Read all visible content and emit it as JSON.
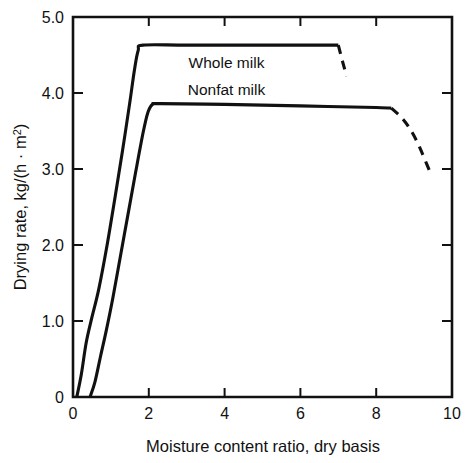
{
  "chart_data": {
    "type": "line",
    "title": "",
    "xlabel": "Moisture content ratio, dry basis",
    "ylabel": "Drying rate, kg/(h · m²)",
    "ylabel_parts": {
      "main": "Drying rate, kg/(h · m",
      "superscript": "2",
      "tail": ")"
    },
    "xlim": [
      0,
      10
    ],
    "ylim": [
      0,
      5.0
    ],
    "xticks": [
      0,
      2,
      4,
      6,
      8,
      10
    ],
    "xticklabels": [
      "0",
      "2",
      "4",
      "6",
      "8",
      "10"
    ],
    "yticks": [
      0,
      1.0,
      2.0,
      3.0,
      4.0,
      5.0
    ],
    "yticklabels": [
      "0",
      "1.0",
      "2.0",
      "3.0",
      "4.0",
      "5.0"
    ],
    "grid": false,
    "legend": "inline-labels",
    "frame": "box",
    "tick_direction": "mixed",
    "series": [
      {
        "name": "Whole milk",
        "label_x": 4.05,
        "label_y": 4.33,
        "solid_points": [
          [
            0.1,
            0.0
          ],
          [
            0.22,
            0.3
          ],
          [
            0.35,
            0.72
          ],
          [
            0.5,
            1.05
          ],
          [
            0.68,
            1.42
          ],
          [
            0.9,
            2.0
          ],
          [
            1.1,
            2.6
          ],
          [
            1.3,
            3.22
          ],
          [
            1.5,
            3.88
          ],
          [
            1.62,
            4.3
          ],
          [
            1.72,
            4.56
          ],
          [
            1.85,
            4.63
          ],
          [
            3.0,
            4.63
          ],
          [
            5.0,
            4.63
          ],
          [
            7.0,
            4.63
          ]
        ],
        "dashed_points": [
          [
            7.0,
            4.63
          ],
          [
            7.12,
            4.4
          ],
          [
            7.22,
            4.22
          ]
        ]
      },
      {
        "name": "Nonfat milk",
        "label_x": 4.05,
        "label_y": 3.97,
        "solid_points": [
          [
            0.45,
            0.0
          ],
          [
            0.58,
            0.2
          ],
          [
            0.72,
            0.52
          ],
          [
            0.88,
            0.88
          ],
          [
            1.05,
            1.3
          ],
          [
            1.25,
            1.85
          ],
          [
            1.45,
            2.4
          ],
          [
            1.65,
            2.95
          ],
          [
            1.85,
            3.48
          ],
          [
            1.98,
            3.75
          ],
          [
            2.1,
            3.85
          ],
          [
            2.3,
            3.86
          ],
          [
            4.0,
            3.85
          ],
          [
            6.0,
            3.83
          ],
          [
            8.0,
            3.81
          ],
          [
            8.4,
            3.8
          ]
        ],
        "dashed_points": [
          [
            8.4,
            3.8
          ],
          [
            8.7,
            3.66
          ],
          [
            8.95,
            3.48
          ],
          [
            9.15,
            3.28
          ],
          [
            9.32,
            3.08
          ],
          [
            9.42,
            2.96
          ]
        ]
      }
    ]
  },
  "figure": {
    "background_color": "#ffffff",
    "line_color": "#111111"
  }
}
